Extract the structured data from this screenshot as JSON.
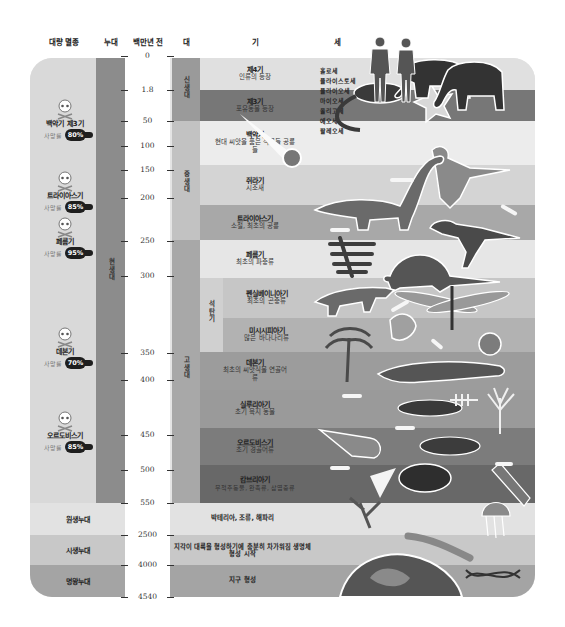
{
  "headers": {
    "mass_extinction": "대량 멸종",
    "eon": "누대",
    "million_years_ago": "백만년 전",
    "era": "대",
    "period": "기",
    "epoch": "세"
  },
  "scale_ticks": [
    "0",
    "1.8",
    "50",
    "100",
    "150",
    "200",
    "250",
    "300",
    "350",
    "400",
    "450",
    "500",
    "550",
    "2500",
    "4000",
    "4540"
  ],
  "eons": {
    "phanerozoic": "현생대",
    "proterozoic": "원생누대",
    "archean": "시생누대",
    "hadean": "명왕누대"
  },
  "eras": {
    "cenozoic": "신생대",
    "mesozoic": "중생대",
    "paleozoic": "고생대",
    "carboniferous": "석탄기"
  },
  "periods": [
    {
      "name": "제4기",
      "desc": "인류의 등장"
    },
    {
      "name": "제3기",
      "desc": "포유동물 등장"
    },
    {
      "name": "백악기",
      "desc": "현대 씨앗을 품은 식물들 공룡들"
    },
    {
      "name": "쥐라기",
      "desc": "시조새"
    },
    {
      "name": "트라이아스기",
      "desc": "소철, 최초의 공룡"
    },
    {
      "name": "페름기",
      "desc": "최초의 파충류"
    },
    {
      "name": "펜실베이니아기",
      "desc": "최초의 곤충류"
    },
    {
      "name": "미시시피아기",
      "desc": "많은 바다나리류"
    },
    {
      "name": "데본기",
      "desc": "최초의 씨앗식물 연골어류"
    },
    {
      "name": "실루리아기",
      "desc": "초기 육지 동물"
    },
    {
      "name": "오르도비스기",
      "desc": "초기 경골어류"
    },
    {
      "name": "캄브리아기",
      "desc": "무척추동물, 완족류, 삽엽충류"
    }
  ],
  "precambrian": [
    {
      "desc": "박테리아, 조류, 해파리"
    },
    {
      "desc": "지각이 대륙을 형성하기에 충분히 차가워짐 생명체 형성 시작"
    },
    {
      "desc": "지구 형성"
    }
  ],
  "epochs": [
    "홀로세",
    "플라이스토세",
    "플라이오세",
    "마이오세",
    "올리고세",
    "에오세",
    "팔레오세"
  ],
  "extinctions": [
    {
      "name": "백악기 제3기",
      "rate_label": "사망률",
      "rate": "80%"
    },
    {
      "name": "트라이아스기",
      "rate_label": "사망률",
      "rate": "85%"
    },
    {
      "name": "페름기",
      "rate_label": "사망률",
      "rate": "95%"
    },
    {
      "name": "데본기",
      "rate_label": "사망률",
      "rate": "70%"
    },
    {
      "name": "오르도비스기",
      "rate_label": "사망률",
      "rate": "85%"
    }
  ],
  "illustrations": [
    "human-figures",
    "mammoth",
    "early-mammal",
    "leaf-fossil",
    "meteor",
    "archaeopteryx",
    "sauropod",
    "theropod",
    "cycad",
    "dimetrodon",
    "reptile",
    "dragonfly",
    "tree-fern",
    "crinoid",
    "ammonite-shell",
    "amphibian",
    "sea-scorpion",
    "fish-skeleton",
    "coral",
    "nautiloid",
    "jawless-fish",
    "trilobite",
    "tooth",
    "worm",
    "jellyfish",
    "algae",
    "dna",
    "earth"
  ],
  "colors": {
    "background": "#ffffff",
    "panel_light": "#e4e4e4",
    "eon_bar": "#8c8c8c",
    "badge": "#1e1e1e"
  }
}
